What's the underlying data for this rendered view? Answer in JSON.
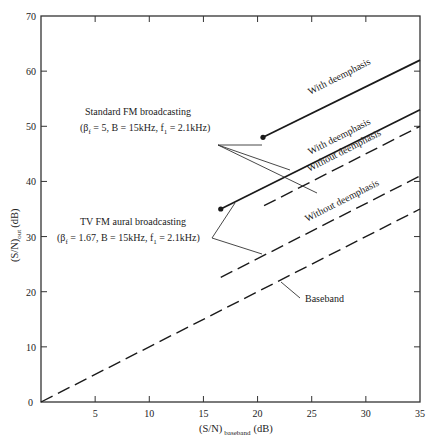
{
  "chart_data": {
    "type": "line",
    "title": "",
    "xlabel": "(S/N)",
    "xlabel_sub": "baseband",
    "xlabel_unit": "(dB)",
    "ylabel": "(S/N)",
    "ylabel_sub": "out",
    "ylabel_unit": "(dB)",
    "xlim": [
      0,
      35
    ],
    "ylim": [
      0,
      70
    ],
    "x_ticks": [
      5,
      10,
      15,
      20,
      25,
      30,
      35
    ],
    "y_ticks": [
      0,
      10,
      20,
      30,
      40,
      50,
      60,
      70
    ],
    "grid": false,
    "legend": "none (inline annotations)",
    "series": [
      {
        "name": "Standard FM broadcasting - With deemphasis",
        "style": "solid",
        "start_dot": true,
        "x": [
          20.5,
          35
        ],
        "y": [
          48,
          62
        ]
      },
      {
        "name": "Standard FM broadcasting - Without deemphasis",
        "style": "dashed",
        "start_dot": false,
        "x": [
          20.6,
          35
        ],
        "y": [
          35.6,
          50
        ]
      },
      {
        "name": "TV FM aural broadcasting - With deemphasis",
        "style": "solid",
        "start_dot": true,
        "x": [
          16.6,
          35
        ],
        "y": [
          35,
          53
        ]
      },
      {
        "name": "TV FM aural broadcasting - Without deemphasis",
        "style": "dashed",
        "start_dot": false,
        "x": [
          16.6,
          35
        ],
        "y": [
          22.6,
          41
        ]
      },
      {
        "name": "Baseband",
        "style": "dashed",
        "start_dot": false,
        "x": [
          0,
          35
        ],
        "y": [
          0,
          35
        ]
      }
    ],
    "annotations": [
      {
        "text": "Standard FM broadcasting",
        "line2": "(βf = 5, B = 15kHz, f1 = 2.1kHz)"
      },
      {
        "text": "TV FM aural broadcasting",
        "line2": "(βf = 1.67, B = 15kHz, f1 = 2.1kHz)"
      },
      {
        "text": "With deemphasis"
      },
      {
        "text": "Without deemphasis"
      },
      {
        "text": "Baseband"
      }
    ]
  },
  "labels": {
    "std_fm_title": "Standard FM broadcasting",
    "std_fm_params_a": "(β",
    "std_fm_params_sub": "f",
    "std_fm_params_b": " = 5, B = 15kHz, f",
    "std_fm_params_sub2": "1",
    "std_fm_params_c": " = 2.1kHz)",
    "tv_fm_title": "TV FM aural broadcasting",
    "tv_fm_params_a": "(β",
    "tv_fm_params_sub": "f",
    "tv_fm_params_b": " = 1.67, B = 15kHz, f",
    "tv_fm_params_sub2": "1",
    "tv_fm_params_c": " = 2.1kHz)",
    "with_deemphasis": "With deemphasis",
    "without_deemphasis": "Without deemphasis",
    "baseband": "Baseband",
    "origin": "0"
  },
  "colors": {
    "line": "#1a1a1a",
    "axis": "#333333",
    "background": "#ffffff"
  }
}
